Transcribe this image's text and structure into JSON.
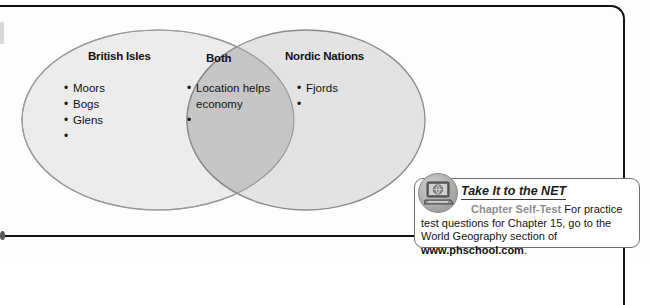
{
  "diagram": {
    "type": "venn",
    "left_circle": {
      "title": "British Isles",
      "items": [
        "Moors",
        "Bogs",
        "Glens",
        ""
      ]
    },
    "overlap": {
      "title": "Both",
      "items": [
        "Location helps",
        "economy",
        ""
      ]
    },
    "right_circle": {
      "title": "Nordic Nations",
      "items": [
        "Fjords",
        ""
      ]
    }
  },
  "net_box": {
    "icon_name": "computer-globe-icon",
    "title": "Take It to the NET",
    "self_test_label": "Chapter Self-Test",
    "body_text": "For practice test questions for Chapter 15, go to the World Geography section of ",
    "website": "www.phschool.com",
    "period": "."
  },
  "colors": {
    "circle_fill": "#ebebeb",
    "overlap_fill": "#c4c4c4",
    "circle_stroke": "#8a8a8a",
    "frame": "#111111",
    "self_test_gray": "#8d8d8d"
  }
}
